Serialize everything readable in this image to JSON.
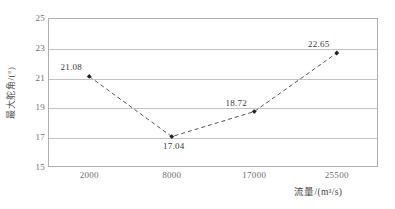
{
  "chart_data": {
    "type": "line",
    "title": "",
    "subtitle": "",
    "xlabel": "流量/(m³/s)",
    "ylabel": "最大舵角/(°)",
    "categories": [
      "2000",
      "8000",
      "17000",
      "25500"
    ],
    "values": [
      21.08,
      17.04,
      18.72,
      22.65
    ],
    "point_labels": [
      "21.08",
      "17.04",
      "18.72",
      "22.65"
    ],
    "point_label_positions": [
      "above-left",
      "below",
      "above-left",
      "above-left"
    ],
    "ylim": [
      15,
      25
    ],
    "yticks": [
      "15",
      "17",
      "19",
      "21",
      "23",
      "25"
    ],
    "ytick_values": [
      15,
      17,
      19,
      21,
      23,
      25
    ],
    "grid": "horizontal",
    "legend": "none",
    "series": [
      {
        "name": "最大舵角",
        "values": [
          21.08,
          17.04,
          18.72,
          22.65
        ],
        "line_style": "dashed",
        "line_color": "#555555",
        "marker": "diamond",
        "marker_color": "#222222"
      }
    ]
  },
  "axes": {
    "y_title": "最大舵角/(°)",
    "x_title": "流量/(m³/s)",
    "frame_color": "#b0b0b0",
    "grid_color": "#c2c2c2",
    "tick_text_color": "#6e6e6e"
  }
}
